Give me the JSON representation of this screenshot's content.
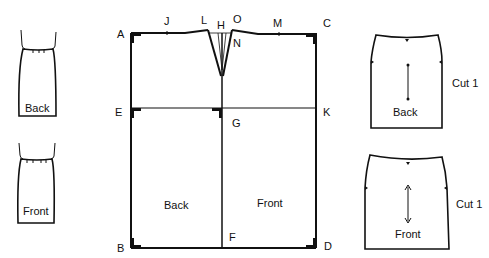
{
  "diagram": {
    "colors": {
      "ink": "#111111",
      "paper": "#ffffff"
    },
    "sketches": [
      {
        "id": "back-sketch",
        "label": "Back"
      },
      {
        "id": "front-sketch",
        "label": "Front"
      }
    ],
    "block": {
      "points": {
        "A": "A",
        "B": "B",
        "C": "C",
        "D": "D",
        "E": "E",
        "F": "F",
        "G": "G",
        "H": "H",
        "J": "J",
        "K": "K",
        "L": "L",
        "M": "M",
        "N": "N",
        "O": "O"
      },
      "panels": {
        "back": "Back",
        "front": "Front"
      }
    },
    "pieces": [
      {
        "id": "back-piece",
        "label": "Back",
        "cut": "Cut 1"
      },
      {
        "id": "front-piece",
        "label": "Front",
        "cut": "Cut 1"
      }
    ]
  }
}
